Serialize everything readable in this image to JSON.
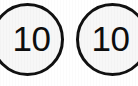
{
  "scene": {
    "description": "two-circular-number-tokens",
    "background_color": "#ffffff",
    "outline_color": "#111111",
    "fill_color": "#f7f7f7",
    "text_color": "#0d0d0d"
  },
  "tokens": [
    {
      "id": "token-left",
      "value": "10",
      "shape": "circle",
      "clipped_edge": "left"
    },
    {
      "id": "token-right",
      "value": "10",
      "shape": "circle",
      "clipped_edge": "right"
    }
  ]
}
